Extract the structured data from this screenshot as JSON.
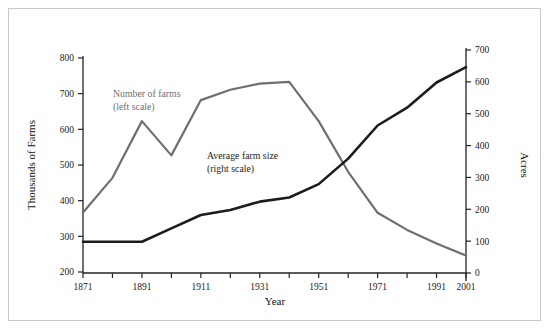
{
  "figure": {
    "width": 549,
    "height": 329,
    "background_color": "#ffffff",
    "border_color": "#c9c9c9"
  },
  "chart_data": {
    "type": "line",
    "title": "",
    "subtitle": "",
    "xlabel": "Year",
    "ylabel": "Thousands of Farms",
    "y2label": "Acres",
    "xlim": [
      1871,
      2001
    ],
    "ylim": [
      200,
      800
    ],
    "y2lim": [
      0,
      700
    ],
    "grid": false,
    "legend_position": "inline-annotations",
    "xticks": [
      1871,
      1891,
      1911,
      1931,
      1951,
      1971,
      1991,
      2001
    ],
    "xtick_labels": [
      "1871",
      "1891",
      "1911",
      "1931",
      "1951",
      "1971",
      "1991",
      "2001"
    ],
    "xminor_ticks": [
      1881,
      1901,
      1921,
      1941,
      1961,
      1981
    ],
    "yticks": [
      200,
      300,
      400,
      500,
      600,
      700,
      800
    ],
    "ytick_labels": [
      "200",
      "300",
      "400",
      "500",
      "600",
      "700",
      "800"
    ],
    "y2ticks": [
      0,
      100,
      200,
      300,
      400,
      500,
      600,
      700
    ],
    "y2tick_labels": [
      "0",
      "100",
      "200",
      "300",
      "400",
      "500",
      "600",
      "700"
    ],
    "series": [
      {
        "name": "Number of farms",
        "axis": "left",
        "color": "#6f6f6f",
        "line_width": 2.2,
        "annotation_line1": "Number of farms",
        "annotation_line2": "(left scale)",
        "x": [
          1871,
          1881,
          1891,
          1901,
          1911,
          1921,
          1931,
          1941,
          1951,
          1961,
          1971,
          1981,
          1991,
          2001
        ],
        "values": [
          367,
          464,
          623,
          527,
          682,
          711,
          728,
          733,
          623,
          481,
          366,
          318,
          280,
          246
        ]
      },
      {
        "name": "Average farm size",
        "axis": "right",
        "color": "#1c1c1c",
        "line_width": 2.6,
        "annotation_line1": "Average farm size",
        "annotation_line2": "(right scale)",
        "x": [
          1871,
          1881,
          1891,
          1901,
          1911,
          1921,
          1931,
          1941,
          1951,
          1961,
          1971,
          1981,
          1991,
          2001
        ],
        "values": [
          98,
          98,
          98,
          140,
          182,
          198,
          224,
          237,
          279,
          359,
          463,
          519,
          598,
          646
        ]
      }
    ]
  },
  "axes": {
    "left_axis_title": "Thousands of Farms",
    "right_axis_title": "Acres",
    "x_axis_title": "Year"
  },
  "annotations": {
    "farms_label_line1": "Number of farms",
    "farms_label_line2": "(left scale)",
    "size_label_line1": "Average farm size",
    "size_label_line2": "(right scale)"
  }
}
